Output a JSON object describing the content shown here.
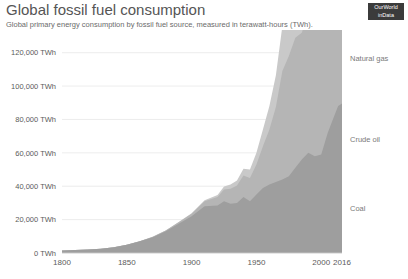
{
  "header": {
    "title": "Global fossil fuel consumption",
    "subtitle": "Global primary energy consumption by fossil fuel source, measured in terawatt-hours (TWh).",
    "badge_line1": "OurWorld",
    "badge_line2": "inData"
  },
  "colors": {
    "coal": "#9e9e9e",
    "oil": "#b5b5b5",
    "gas": "#c9c9c9",
    "grid": "#e4e4e4",
    "axis_text": "#5b5b5b",
    "title_text": "#555555",
    "badge_bg": "#3b3b3b"
  },
  "chart_data": {
    "type": "area",
    "stacked": true,
    "title": "Global fossil fuel consumption",
    "subtitle": "Global primary energy consumption by fossil fuel source, measured in terawatt-hours (TWh).",
    "xlabel": "",
    "ylabel": "",
    "unit": "TWh",
    "grid": true,
    "legend_position": "right-inline",
    "xlim": [
      1800,
      2016
    ],
    "ylim": [
      0,
      130000
    ],
    "xticks": [
      1800,
      1850,
      1900,
      1950,
      2000,
      2016
    ],
    "xtick_labels": [
      "1800",
      "1850",
      "1900",
      "1950",
      "2000",
      "2016"
    ],
    "yticks": [
      0,
      20000,
      40000,
      60000,
      80000,
      100000,
      120000
    ],
    "ytick_labels": [
      "0 TWh",
      "20,000 TWh",
      "40,000 TWh",
      "60,000 TWh",
      "80,000 TWh",
      "100,000 TWh",
      "120,000 TWh"
    ],
    "x": [
      1800,
      1810,
      1820,
      1830,
      1840,
      1850,
      1860,
      1870,
      1880,
      1890,
      1900,
      1910,
      1920,
      1925,
      1930,
      1935,
      1940,
      1945,
      1950,
      1955,
      1960,
      1965,
      1970,
      1975,
      1980,
      1985,
      1990,
      1995,
      2000,
      2005,
      2010,
      2013,
      2016
    ],
    "series": [
      {
        "name": "Coal",
        "color": "#9e9e9e",
        "values": [
          1540,
          1800,
          2100,
          2600,
          3500,
          5000,
          7000,
          9500,
          13000,
          17500,
          22000,
          28000,
          28500,
          31000,
          29500,
          30000,
          33500,
          31000,
          35000,
          39000,
          41000,
          42500,
          44000,
          46000,
          51000,
          56000,
          60000,
          58000,
          59000,
          72000,
          82000,
          88000,
          89500
        ],
        "final_value": 89500
      },
      {
        "name": "Crude oil",
        "color": "#b5b5b5",
        "values": [
          0,
          0,
          0,
          0,
          0,
          0,
          50,
          200,
          500,
          900,
          1500,
          3000,
          5000,
          7000,
          9000,
          10500,
          13000,
          14000,
          18000,
          25000,
          33000,
          45000,
          65000,
          72000,
          78000,
          76000,
          84000,
          88000,
          95000,
          102000,
          105000,
          108000,
          110000
        ],
        "final_value": 110000
      },
      {
        "name": "Natural gas",
        "color": "#c9c9c9",
        "values": [
          0,
          0,
          0,
          0,
          0,
          0,
          0,
          0,
          50,
          150,
          300,
          600,
          1200,
          1800,
          2500,
          3000,
          4000,
          5000,
          7000,
          10000,
          14000,
          19000,
          27000,
          32000,
          38000,
          42000,
          48000,
          52000,
          58000,
          64000,
          72000,
          75000,
          78000
        ],
        "final_value": 78000
      }
    ],
    "series_labels": [
      {
        "name": "Natural gas",
        "y_value": 117000
      },
      {
        "name": "Crude oil",
        "y_value": 68000
      },
      {
        "name": "Coal",
        "y_value": 27000
      }
    ]
  }
}
